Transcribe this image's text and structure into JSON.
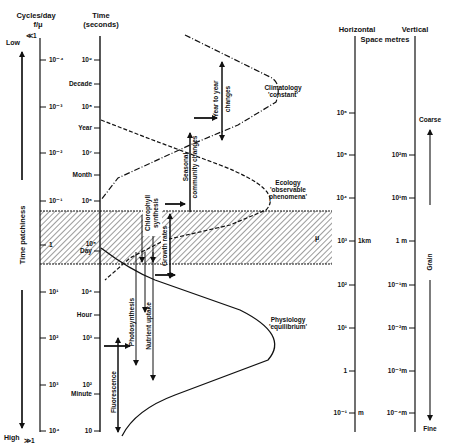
{
  "headers": {
    "cycles": "Cycles/day",
    "cycles_sub": "f/μ",
    "time": "Time",
    "time_sub": "(seconds)",
    "horizontal": "Horizontal",
    "vertical": "Vertical",
    "space": "Space metres"
  },
  "patchiness": {
    "low": "Low",
    "low_sup": "≪1",
    "high": "High",
    "high_sub": "≫1",
    "label": "Time patchiness"
  },
  "cycles_ticks": [
    {
      "label": "10⁻⁴",
      "y": 60
    },
    {
      "label": "10⁻³",
      "y": 107
    },
    {
      "label": "10⁻²",
      "y": 153
    },
    {
      "label": "10⁻¹",
      "y": 201
    },
    {
      "label": "1",
      "y": 245
    },
    {
      "label": "10¹",
      "y": 292
    },
    {
      "label": "10²",
      "y": 338
    },
    {
      "label": "10³",
      "y": 385
    },
    {
      "label": "10⁴",
      "y": 431
    }
  ],
  "time_ticks": [
    {
      "label": "10⁹",
      "y": 60
    },
    {
      "label": "Decade",
      "y": 84
    },
    {
      "label": "10⁸",
      "y": 107
    },
    {
      "label": "Year",
      "y": 128
    },
    {
      "label": "10⁷",
      "y": 153
    },
    {
      "label": "Month",
      "y": 175
    },
    {
      "label": "10⁶",
      "y": 201
    },
    {
      "label": "10⁵",
      "y": 245
    },
    {
      "label": "Day",
      "y": 251
    },
    {
      "label": "10⁴",
      "y": 292
    },
    {
      "label": "Hour",
      "y": 315
    },
    {
      "label": "10³",
      "y": 338
    },
    {
      "label": "10²",
      "y": 385
    },
    {
      "label": "Minute",
      "y": 394
    },
    {
      "label": "10",
      "y": 431
    }
  ],
  "horizontal_ticks": [
    {
      "label": "10⁶",
      "y": 113
    },
    {
      "label": "10⁵",
      "y": 155
    },
    {
      "label": "10⁴",
      "y": 198
    },
    {
      "label": "10³",
      "y": 241,
      "unit": "1km"
    },
    {
      "label": "10²",
      "y": 285
    },
    {
      "label": "10¹",
      "y": 328
    },
    {
      "label": "1",
      "y": 371
    },
    {
      "label": "10⁻¹",
      "y": 413,
      "unit": "m"
    }
  ],
  "vertical_ticks": [
    {
      "label": "10²m",
      "y": 155
    },
    {
      "label": "10¹m",
      "y": 198
    },
    {
      "label": "1  m",
      "y": 241
    },
    {
      "label": "10⁻¹m",
      "y": 285
    },
    {
      "label": "10⁻²m",
      "y": 328
    },
    {
      "label": "10⁻³m",
      "y": 371
    },
    {
      "label": "10⁻⁴m",
      "y": 413
    }
  ],
  "grain": {
    "coarse": "Coarse",
    "label": "Grain",
    "fine": "Fine"
  },
  "band_label": "μ",
  "regimes": {
    "climatology": [
      "Climatology",
      "'constant'"
    ],
    "ecology": [
      "Ecology",
      "'observable",
      "phenomena'"
    ],
    "physiology": [
      "Physiology",
      "'equilibrium'"
    ]
  },
  "processes": {
    "year_to_year": [
      "Year to year",
      "changes"
    ],
    "seasonal": [
      "Seasonal",
      "community changes"
    ],
    "chlorophyll": [
      "Chlorophyll",
      "synthesis"
    ],
    "growth": "Growth rates",
    "photosynthesis": "Photosynthesis",
    "nutrient": "Nutrient uptake",
    "fluorescence": "Fluorescence"
  }
}
